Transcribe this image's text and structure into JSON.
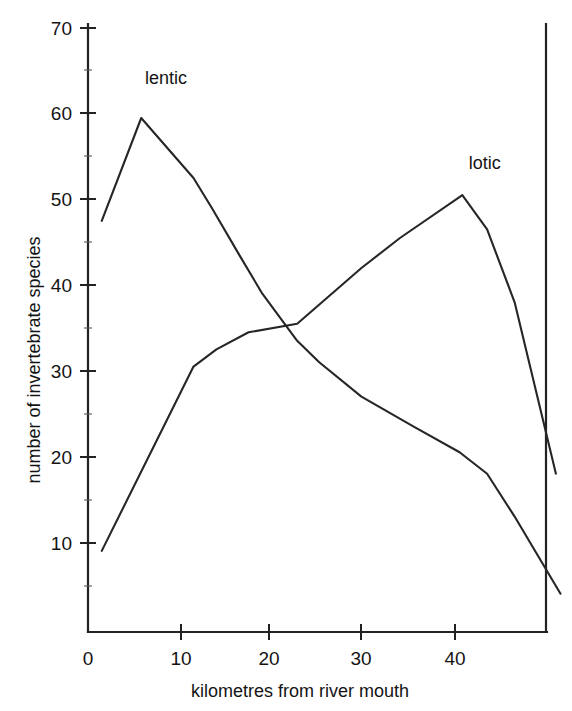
{
  "figure": {
    "background_color": "#ffffff",
    "ink_color": "#262626"
  },
  "chart_data": {
    "type": "line",
    "title": "",
    "xlabel": "kilometres from river mouth",
    "ylabel": "number of invertebrate species",
    "xlim": [
      0,
      52
    ],
    "ylim": [
      0,
      70
    ],
    "xticks": [
      0,
      10,
      20,
      30,
      40
    ],
    "yticks": [
      10,
      20,
      30,
      40,
      50,
      60,
      70
    ],
    "xtick_labels": [
      "0",
      "10",
      "20",
      "30",
      "40"
    ],
    "ytick_labels": [
      "10",
      "20",
      "30",
      "40",
      "50",
      "60",
      "70"
    ],
    "grid": false,
    "legend_position": "inline-annotations",
    "series": [
      {
        "name": "lentic",
        "label": "lentic",
        "label_x": 6.2,
        "label_y": 63.5,
        "x": [
          1.5,
          5.8,
          11.5,
          13.5,
          16.5,
          19.0,
          22.8,
          25.2,
          29.8,
          35.5,
          40.5,
          43.5,
          46.5,
          51.5
        ],
        "y": [
          47.5,
          59.5,
          52.5,
          49.0,
          43.5,
          39.0,
          33.5,
          31.0,
          27.0,
          23.5,
          20.5,
          18.0,
          13.0,
          4.0
        ]
      },
      {
        "name": "lotic",
        "label": "lotic",
        "label_x": 41.5,
        "label_y": 53.5,
        "x": [
          1.5,
          11.5,
          14.0,
          17.5,
          22.8,
          29.8,
          34.0,
          40.8,
          43.5,
          46.5,
          51.0
        ],
        "y": [
          9.0,
          30.5,
          32.5,
          34.5,
          35.5,
          42.0,
          45.5,
          50.5,
          46.5,
          38.0,
          18.0
        ]
      }
    ],
    "crossing_point": {
      "x": 19.0,
      "y": 34.0
    }
  },
  "axis": {
    "x_axis_name": "x-axis",
    "y_axis_name": "y-axis",
    "right_frame_name": "right-frame-line"
  }
}
